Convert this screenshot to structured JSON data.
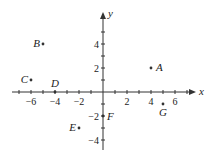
{
  "diagram": {
    "type": "coordinate-plane",
    "axes": {
      "x_label": "x",
      "y_label": "y"
    },
    "x_ticks": [
      {
        "v": -6,
        "label": "-6"
      },
      {
        "v": -4,
        "label": "-4"
      },
      {
        "v": -2,
        "label": "-2"
      },
      {
        "v": 2,
        "label": "2"
      },
      {
        "v": 4,
        "label": "4"
      },
      {
        "v": 6,
        "label": "6"
      }
    ],
    "y_ticks": [
      {
        "v": 4,
        "label": "4"
      },
      {
        "v": 2,
        "label": "2"
      },
      {
        "v": -2,
        "label": "-2"
      },
      {
        "v": -4,
        "label": "-4"
      }
    ],
    "points": [
      {
        "name": "A",
        "x": 4,
        "y": 2
      },
      {
        "name": "B",
        "x": -5,
        "y": 4
      },
      {
        "name": "C",
        "x": -6,
        "y": 1
      },
      {
        "name": "D",
        "x": -4,
        "y": 0
      },
      {
        "name": "E",
        "x": -2,
        "y": -3
      },
      {
        "name": "F",
        "x": 0,
        "y": -2
      },
      {
        "name": "G",
        "x": 5,
        "y": -1
      }
    ]
  }
}
